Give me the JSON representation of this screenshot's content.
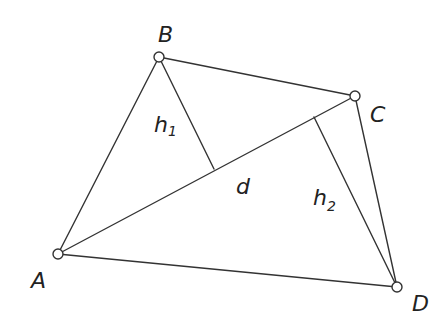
{
  "diagram": {
    "stroke_color": "#333333",
    "background": "#ffffff",
    "vertices": {
      "A": {
        "label": "A",
        "x": 58,
        "y": 254
      },
      "B": {
        "label": "B",
        "x": 159,
        "y": 57
      },
      "C": {
        "label": "C",
        "x": 355,
        "y": 96
      },
      "D": {
        "label": "D",
        "x": 397,
        "y": 287
      }
    },
    "feet": {
      "h1_foot": {
        "x": 214,
        "y": 169
      },
      "h2_foot": {
        "x": 314,
        "y": 117
      }
    },
    "labels": {
      "A": "A",
      "B": "B",
      "C": "C",
      "D": "D",
      "d": "d",
      "h1_base": "h",
      "h1_sub": "1",
      "h2_base": "h",
      "h2_sub": "2"
    },
    "edges": [
      {
        "from": "A",
        "to": "B"
      },
      {
        "from": "B",
        "to": "C"
      },
      {
        "from": "C",
        "to": "D"
      },
      {
        "from": "D",
        "to": "A"
      },
      {
        "from": "A",
        "to": "C",
        "name": "d"
      },
      {
        "from": "B",
        "to": "h1_foot",
        "name": "h1"
      },
      {
        "from": "D",
        "to": "h2_foot",
        "name": "h2"
      }
    ]
  }
}
